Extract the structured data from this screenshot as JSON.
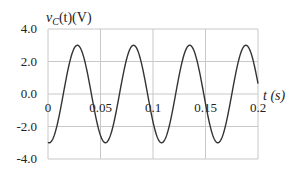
{
  "chart_data": {
    "type": "line",
    "title": "",
    "ylabel": "v_C(t)(V)",
    "xlabel": "t(s)",
    "xlim": [
      0,
      0.2
    ],
    "ylim": [
      -4.0,
      4.0
    ],
    "grid": true,
    "legend": null,
    "x_ticks": [
      "0",
      "0.05",
      "0.1",
      "0.15",
      "0.2"
    ],
    "x_tick_values": [
      0,
      0.05,
      0.1,
      0.15,
      0.2
    ],
    "y_ticks": [
      "4.0",
      "2.0",
      "0.0",
      "-2.0",
      "-4.0"
    ],
    "y_tick_values": [
      4.0,
      2.0,
      0.0,
      -2.0,
      -4.0
    ],
    "series": [
      {
        "name": "v_C(t)",
        "description": "Sinusoid, amplitude ~3 V, period ~0.0535 s (~18.7 Hz), starting near minimum -3 V at t=0",
        "amplitude": 3.0,
        "period": 0.0535,
        "x": [
          0,
          0.005,
          0.01,
          0.015,
          0.02,
          0.025,
          0.03,
          0.035,
          0.04,
          0.045,
          0.05,
          0.055,
          0.06,
          0.065,
          0.07,
          0.075,
          0.08,
          0.085,
          0.09,
          0.095,
          0.1,
          0.105,
          0.11,
          0.115,
          0.12,
          0.125,
          0.13,
          0.135,
          0.14,
          0.145,
          0.15,
          0.155,
          0.16,
          0.165,
          0.17,
          0.175,
          0.18,
          0.185,
          0.19,
          0.195,
          0.2
        ],
        "values": [
          -2.98,
          -2.43,
          -1.11,
          0.55,
          1.98,
          2.86,
          2.94,
          2.21,
          0.87,
          -0.77,
          -2.16,
          -2.95,
          -2.89,
          -1.98,
          -0.55,
          1.05,
          2.39,
          2.99,
          2.74,
          1.73,
          0.24,
          -1.35,
          -2.59,
          -3.0,
          -2.57,
          -1.33,
          0.27,
          1.75,
          2.75,
          2.99,
          2.38,
          1.04,
          -0.58,
          -2.0,
          -2.89,
          -2.95,
          -2.14,
          -0.72,
          0.9,
          2.24,
          2.96
        ]
      }
    ]
  },
  "labels": {
    "ylabel_var": "v",
    "ylabel_sub": "C",
    "ylabel_rest": "(t)(V)",
    "xlabel": "t (s)"
  }
}
